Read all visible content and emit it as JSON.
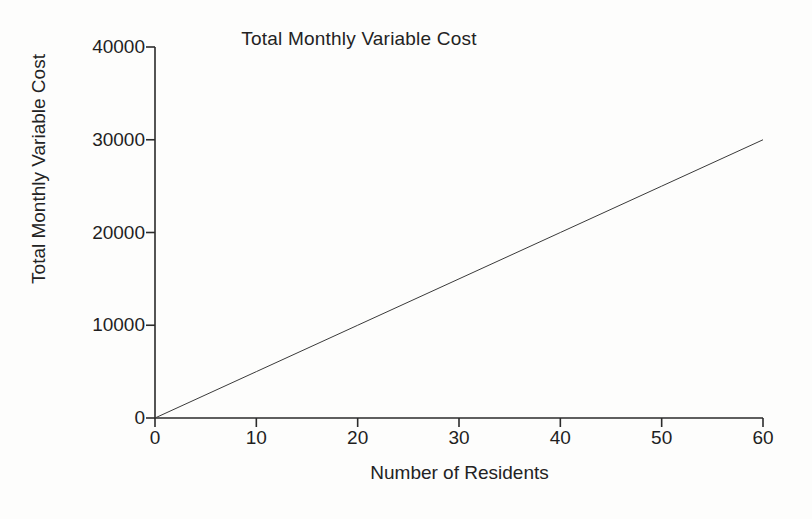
{
  "chart_data": {
    "type": "line",
    "title": "Total Monthly Variable Cost",
    "xlabel": "Number of Residents",
    "ylabel": "Total Monthly Variable Cost",
    "xlim": [
      0,
      60
    ],
    "ylim": [
      0,
      40000
    ],
    "xticks": [
      0,
      10,
      20,
      30,
      40,
      50,
      60
    ],
    "xtick_labels": [
      "0",
      "10",
      "20",
      "30",
      "40",
      "50",
      "60"
    ],
    "yticks": [
      0,
      10000,
      20000,
      30000,
      40000
    ],
    "ytick_labels": [
      "0",
      "10000",
      "20000",
      "30000",
      "40000"
    ],
    "grid": false,
    "legend": false,
    "legend_position": "none",
    "series": [
      {
        "name": "Total Monthly Variable Cost",
        "color": "#3a3a3a",
        "line_width": 1,
        "slope_per_resident": 500,
        "x": [
          0,
          10,
          20,
          30,
          40,
          50,
          60
        ],
        "values": [
          0,
          5000,
          10000,
          15000,
          20000,
          25000,
          30000
        ]
      }
    ]
  },
  "style": {
    "background": "#fdfdfc",
    "axis_color": "#2b2b2b",
    "text_color": "#232323",
    "line_color": "#3a3a3a"
  }
}
